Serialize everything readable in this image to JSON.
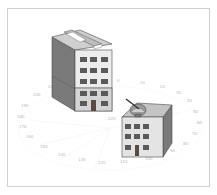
{
  "figure": {
    "colors": {
      "frame_border": "#cfcfcf",
      "wall_front": "#e8e8e8",
      "wall_side": "#7a7a7a",
      "roof": "#bdbdbd",
      "window": "#5a5a5a",
      "ring_labels": "#b8b8b8"
    }
  },
  "buildings": [
    {
      "name": "tall building",
      "floors_windows": "3x5 grid",
      "has_rooftop_unit": true
    },
    {
      "name": "short building",
      "floors_windows": "3x3 grid",
      "has_satellite_dish": true
    }
  ],
  "azimuth_labels": {
    "ring": [
      "0",
      "10",
      "20",
      "30",
      "40",
      "50",
      "60",
      "70",
      "80",
      "90",
      "100",
      "110",
      "120",
      "130",
      "140",
      "150",
      "160",
      "170",
      "180",
      "190",
      "200",
      "210",
      "220",
      "230",
      "240",
      "250",
      "260",
      "270",
      "280",
      "290",
      "300",
      "310",
      "320",
      "330",
      "340",
      "350"
    ]
  }
}
